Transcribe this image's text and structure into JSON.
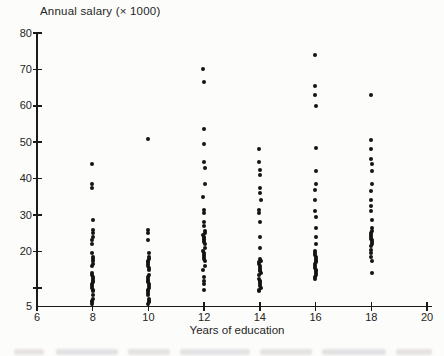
{
  "figure": {
    "kind": "scanned textbook scatter plot",
    "background_color": "#fcfcfa",
    "axis_color": "#1a1a1a",
    "marker_color": "#141414"
  },
  "chart_data": {
    "type": "scatter",
    "title": "Annual salary (× 1000)",
    "xlabel": "Years of education",
    "ylabel": "Annual salary (× 1000)",
    "xlim": [
      6,
      20
    ],
    "ylim": [
      5,
      80
    ],
    "x_ticks": [
      6,
      8,
      10,
      12,
      14,
      16,
      18,
      20
    ],
    "x_tick_labels": [
      "6",
      "8",
      "10",
      "12",
      "14",
      "16",
      "18",
      "20"
    ],
    "y_ticks": [
      10,
      20,
      30,
      40,
      50,
      60,
      70,
      80
    ],
    "y_tick_labels_shown": [
      "5",
      "20",
      "30",
      "40",
      "50",
      "60",
      "70",
      "80"
    ],
    "grid": false,
    "legend": "none",
    "marker": {
      "shape": "dot",
      "size_px": 4,
      "color": "#141414"
    },
    "series": [
      {
        "name": "education-8",
        "x": 8,
        "salaries": [
          44,
          38.5,
          37.5,
          28.5,
          26,
          25,
          24,
          23,
          22,
          19.5,
          18.5,
          18,
          17.5,
          16.5,
          16,
          14,
          13.5,
          13,
          12.5,
          12,
          11.5,
          11,
          10.5,
          10,
          9.5,
          9,
          8,
          7,
          6.5,
          6,
          5.5
        ]
      },
      {
        "name": "education-10",
        "x": 10,
        "salaries": [
          51,
          26,
          25,
          23,
          19.5,
          18.5,
          18,
          17.5,
          17,
          16.5,
          16,
          15.5,
          15,
          13.5,
          13,
          12.5,
          12,
          11.5,
          11,
          10.5,
          10,
          9.5,
          9,
          8.5,
          8,
          7,
          6.5,
          6,
          5.5
        ]
      },
      {
        "name": "education-12",
        "x": 12,
        "salaries": [
          70,
          66.5,
          53.5,
          49.5,
          44.5,
          43,
          38.5,
          35,
          31.5,
          30.5,
          28,
          27,
          25.5,
          25,
          24.5,
          24,
          23.5,
          23,
          22.5,
          22,
          21,
          20,
          19.5,
          19,
          18.5,
          18,
          17.5,
          16,
          15,
          13,
          12,
          11,
          9.5
        ]
      },
      {
        "name": "education-14",
        "x": 14,
        "salaries": [
          48,
          44.5,
          42.5,
          41,
          37.5,
          36,
          34,
          31.5,
          30.5,
          28,
          24,
          21,
          18,
          17.5,
          17,
          16.5,
          16,
          15.5,
          15,
          14.5,
          14,
          13.5,
          12.5,
          12,
          11.5,
          11,
          10.5,
          10,
          9.5,
          9
        ]
      },
      {
        "name": "education-16",
        "x": 16,
        "salaries": [
          74,
          65.5,
          63,
          60,
          48.5,
          42,
          38.5,
          37,
          34,
          31,
          29.5,
          26.5,
          24,
          22,
          20,
          19.5,
          19,
          18.5,
          18,
          17.5,
          17,
          16.5,
          16,
          15.5,
          15,
          14.5,
          14,
          13.5,
          13,
          12.5
        ]
      },
      {
        "name": "education-18",
        "x": 18,
        "salaries": [
          63,
          50.5,
          48,
          45.5,
          44,
          42,
          38.5,
          36.5,
          34,
          32.5,
          31,
          28.5,
          26.5,
          25.5,
          25,
          24.5,
          24,
          23.5,
          23,
          22.5,
          22,
          21.5,
          20.5,
          19.5,
          18.5,
          17.5,
          14
        ]
      }
    ],
    "layout_px": {
      "x_at_6": 37,
      "x_at_20": 427,
      "y_at_5": 306,
      "y_at_80": 33
    }
  },
  "footer": {
    "note_is_legible": false
  }
}
